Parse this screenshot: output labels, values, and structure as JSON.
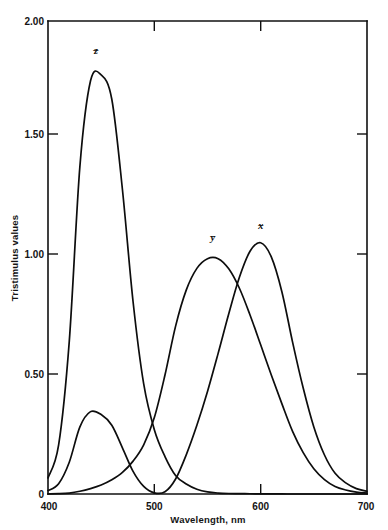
{
  "chart_data": {
    "type": "line",
    "title": "",
    "xlabel": "Wavelength, nm",
    "ylabel": "Tristimulus values",
    "xlim": [
      400,
      700
    ],
    "ylim": [
      0,
      2.0
    ],
    "grid": false,
    "legend_position": "inline-curve-labels",
    "xticks": [
      400,
      500,
      600,
      700
    ],
    "xtick_labels": [
      "400",
      "500",
      "600",
      "700"
    ],
    "yticks": [
      0,
      0.5,
      1.0,
      1.5,
      2.0
    ],
    "ytick_labels": [
      "0",
      "0.50",
      "1.00",
      "1.50",
      "2.00"
    ],
    "x": [
      400,
      410,
      420,
      430,
      440,
      450,
      460,
      470,
      480,
      490,
      500,
      510,
      520,
      530,
      540,
      550,
      560,
      570,
      580,
      590,
      600,
      610,
      620,
      630,
      640,
      650,
      660,
      670,
      680,
      690,
      700
    ],
    "series": [
      {
        "name": "x-bar",
        "label": "x̄",
        "label_x": 600,
        "label_y": 1.12,
        "peak_x": 600,
        "peak_y": 1.062,
        "secondary_peak_x": 445,
        "secondary_peak_y": 0.348,
        "values": [
          0.0143,
          0.0435,
          0.1344,
          0.2839,
          0.3483,
          0.3362,
          0.2908,
          0.1954,
          0.0956,
          0.032,
          0.0049,
          0.0093,
          0.0633,
          0.1655,
          0.2904,
          0.4334,
          0.5945,
          0.7621,
          0.9163,
          1.0263,
          1.0622,
          1.0026,
          0.8544,
          0.6424,
          0.4479,
          0.2835,
          0.1649,
          0.0874,
          0.0468,
          0.0227,
          0.0114
        ]
      },
      {
        "name": "y-bar",
        "label": "ȳ",
        "label_x": 555,
        "label_y": 1.07,
        "peak_x": 555,
        "peak_y": 1.0,
        "values": [
          0.000396,
          0.00121,
          0.004,
          0.0116,
          0.023,
          0.038,
          0.06,
          0.091,
          0.139,
          0.208,
          0.323,
          0.503,
          0.71,
          0.862,
          0.954,
          0.995,
          0.995,
          0.952,
          0.87,
          0.757,
          0.631,
          0.503,
          0.381,
          0.265,
          0.175,
          0.107,
          0.061,
          0.032,
          0.017,
          0.0082,
          0.0041
        ]
      },
      {
        "name": "z-bar",
        "label": "z̄",
        "label_x": 445,
        "label_y": 1.86,
        "peak_x": 445,
        "peak_y": 1.78,
        "values": [
          0.0679,
          0.2074,
          0.6456,
          1.3856,
          1.7471,
          1.7721,
          1.6692,
          1.2876,
          0.813,
          0.4652,
          0.272,
          0.1582,
          0.0782,
          0.0422,
          0.0203,
          0.0087,
          0.0039,
          0.0021,
          0.0017,
          0.0011,
          0.0008,
          0.0003,
          0.0002,
          0.0,
          0.0,
          0.0,
          0.0,
          0.0,
          0.0,
          0.0,
          0.0
        ]
      }
    ]
  },
  "axes": {
    "y_title": "Tristimulus values",
    "x_title": "Wavelength, nm"
  },
  "labels": {
    "y_2_00": "2.00",
    "y_1_50": "1.50",
    "y_1_00": "1.00",
    "y_0_50": "0.50",
    "y_0": "0",
    "x_400": "400",
    "x_500": "500",
    "x_600": "600",
    "x_700": "700",
    "curve_x": "x",
    "curve_y": "y",
    "curve_z": "z",
    "overbar": "_"
  },
  "colors": {
    "background": "#ffffff",
    "axis": "#101010",
    "curve": "#0d0d0d",
    "text": "#141414"
  }
}
